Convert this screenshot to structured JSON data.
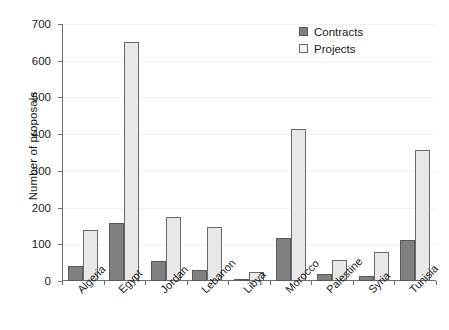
{
  "chart_data": {
    "type": "bar",
    "title": "",
    "xlabel": "",
    "ylabel": "Number of proposals",
    "ylim": [
      0,
      700
    ],
    "ytick_step": 100,
    "yticks": [
      0,
      100,
      200,
      300,
      400,
      500,
      600,
      700
    ],
    "grid": true,
    "legend_position": "top-right",
    "categories": [
      "Algeria",
      "Egypt",
      "Jordan",
      "Lebanon",
      "Libya",
      "Morocco",
      "Palestine",
      "Syria",
      "Tunisia"
    ],
    "series": [
      {
        "name": "Contracts",
        "color": "#808080",
        "values": [
          40,
          158,
          55,
          30,
          5,
          118,
          18,
          14,
          112
        ]
      },
      {
        "name": "Projects",
        "color": "#e8e8e8",
        "values": [
          138,
          650,
          175,
          147,
          25,
          415,
          57,
          80,
          358
        ]
      }
    ]
  },
  "legend": {
    "items": [
      {
        "label": "Contracts",
        "swatch": "contracts"
      },
      {
        "label": "Projects",
        "swatch": "projects"
      }
    ]
  }
}
